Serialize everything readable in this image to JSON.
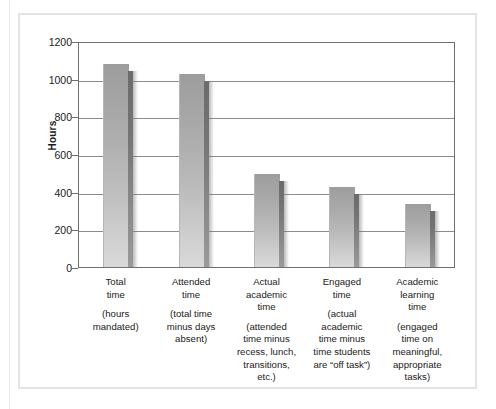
{
  "figure": {
    "y_axis_title": "Hours"
  },
  "chart_data": {
    "type": "bar",
    "title": "",
    "subtitle": "",
    "xlabel": "",
    "ylabel": "Hours",
    "ylim": [
      0,
      1200
    ],
    "ytick_labels": [
      "1200",
      "1000",
      "800",
      "600",
      "400",
      "200",
      "0"
    ],
    "yticks": [
      1200,
      1000,
      800,
      600,
      400,
      200,
      0
    ],
    "grid": true,
    "legend": "none",
    "categories": [
      "Total time (hours mandated)",
      "Attended time (total time minus days absent)",
      "Actual academic time (attended time minus recess, lunch, transitions, etc.)",
      "Engaged time (actual academic time minus time students are “off task”)",
      "Academic learning time (engaged time on meaningful, appropriate tasks)"
    ],
    "values": [
      1080,
      1025,
      495,
      423,
      335
    ],
    "bars": [
      {
        "head": "Total\ntime",
        "sub": "(hours\nmandated)",
        "value": 1080
      },
      {
        "head": "Attended\ntime",
        "sub": "(total time\nminus days\nabsent)",
        "value": 1025
      },
      {
        "head": "Actual\nacademic\ntime",
        "sub": "(attended\ntime minus\nrecess, lunch,\ntransitions,\netc.)",
        "value": 495
      },
      {
        "head": "Engaged\ntime",
        "sub": "(actual\nacademic\ntime minus\ntime students\nare “off task”)",
        "value": 423
      },
      {
        "head": "Academic\nlearning\ntime",
        "sub": "(engaged\ntime on\nmeaningful,\nappropriate\ntasks)",
        "value": 335
      }
    ]
  },
  "colors": {
    "bar_face_top": "#9d9d9d",
    "bar_face_bottom": "#d9d9d9",
    "bar_side": "#767676",
    "axis": "#6f6f6f",
    "gridline": "#8c8c8c",
    "frame": "#e3e4e6",
    "text": "#1a1a1a",
    "background": "#ffffff"
  }
}
